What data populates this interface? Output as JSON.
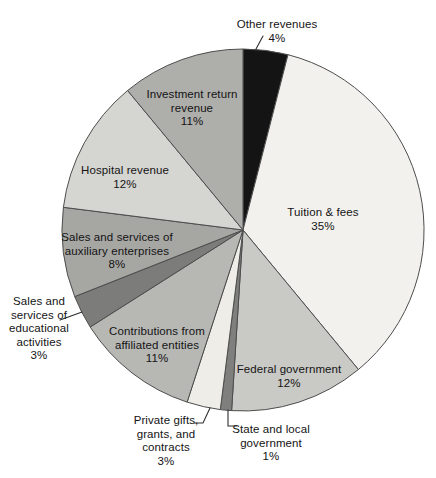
{
  "figure": {
    "background": "#ffffff",
    "slice_outline_color": "#4d4d4d",
    "leader_line_color": "#2e2e2e",
    "text_color": "#141414"
  },
  "chart_data": {
    "type": "pie",
    "title": "",
    "unit": "%",
    "start_angle_clockwise_from_top_deg": 0,
    "legend_position": "none",
    "total": 100,
    "slices": [
      {
        "id": "other",
        "label": "Other revenues",
        "value": 4,
        "percent_label": "4%",
        "lines": [
          "Other revenues"
        ],
        "color": "#141414",
        "label_placement": "outside-top"
      },
      {
        "id": "tuition",
        "label": "Tuition & fees",
        "value": 35,
        "percent_label": "35%",
        "lines": [
          "Tuition & fees"
        ],
        "color": "#f2f1ee",
        "label_placement": "inside"
      },
      {
        "id": "federal",
        "label": "Federal government",
        "value": 12,
        "percent_label": "12%",
        "lines": [
          "Federal government"
        ],
        "color": "#c9c9c6",
        "label_placement": "inside"
      },
      {
        "id": "state",
        "label": "State and local government",
        "value": 1,
        "percent_label": "1%",
        "lines": [
          "State and local",
          "government"
        ],
        "color": "#7f7f7d",
        "label_placement": "outside-bottom"
      },
      {
        "id": "private",
        "label": "Private gifts, grants, and contracts",
        "value": 3,
        "percent_label": "3%",
        "lines": [
          "Private gifts,",
          "grants, and",
          "contracts"
        ],
        "color": "#eeede8",
        "label_placement": "outside-bottom"
      },
      {
        "id": "contributions",
        "label": "Contributions from affiliated entities",
        "value": 11,
        "percent_label": "11%",
        "lines": [
          "Contributions from",
          "affiliated entities"
        ],
        "color": "#b7b7b4",
        "label_placement": "inside"
      },
      {
        "id": "educational",
        "label": "Sales and services of educational activities",
        "value": 3,
        "percent_label": "3%",
        "lines": [
          "Sales and",
          "services of",
          "educational",
          "activities"
        ],
        "color": "#7c7c7a",
        "label_placement": "outside-left"
      },
      {
        "id": "auxiliary",
        "label": "Sales and services of auxiliary enterprises",
        "value": 8,
        "percent_label": "8%",
        "lines": [
          "Sales and services of",
          "auxiliary enterprises"
        ],
        "color": "#a6a6a3",
        "label_placement": "inside"
      },
      {
        "id": "hospital",
        "label": "Hospital revenue",
        "value": 12,
        "percent_label": "12%",
        "lines": [
          "Hospital revenue"
        ],
        "color": "#d5d5d2",
        "label_placement": "inside"
      },
      {
        "id": "investment",
        "label": "Investment return revenue",
        "value": 11,
        "percent_label": "11%",
        "lines": [
          "Investment return",
          "revenue"
        ],
        "color": "#aeaeab",
        "label_placement": "inside"
      }
    ]
  }
}
